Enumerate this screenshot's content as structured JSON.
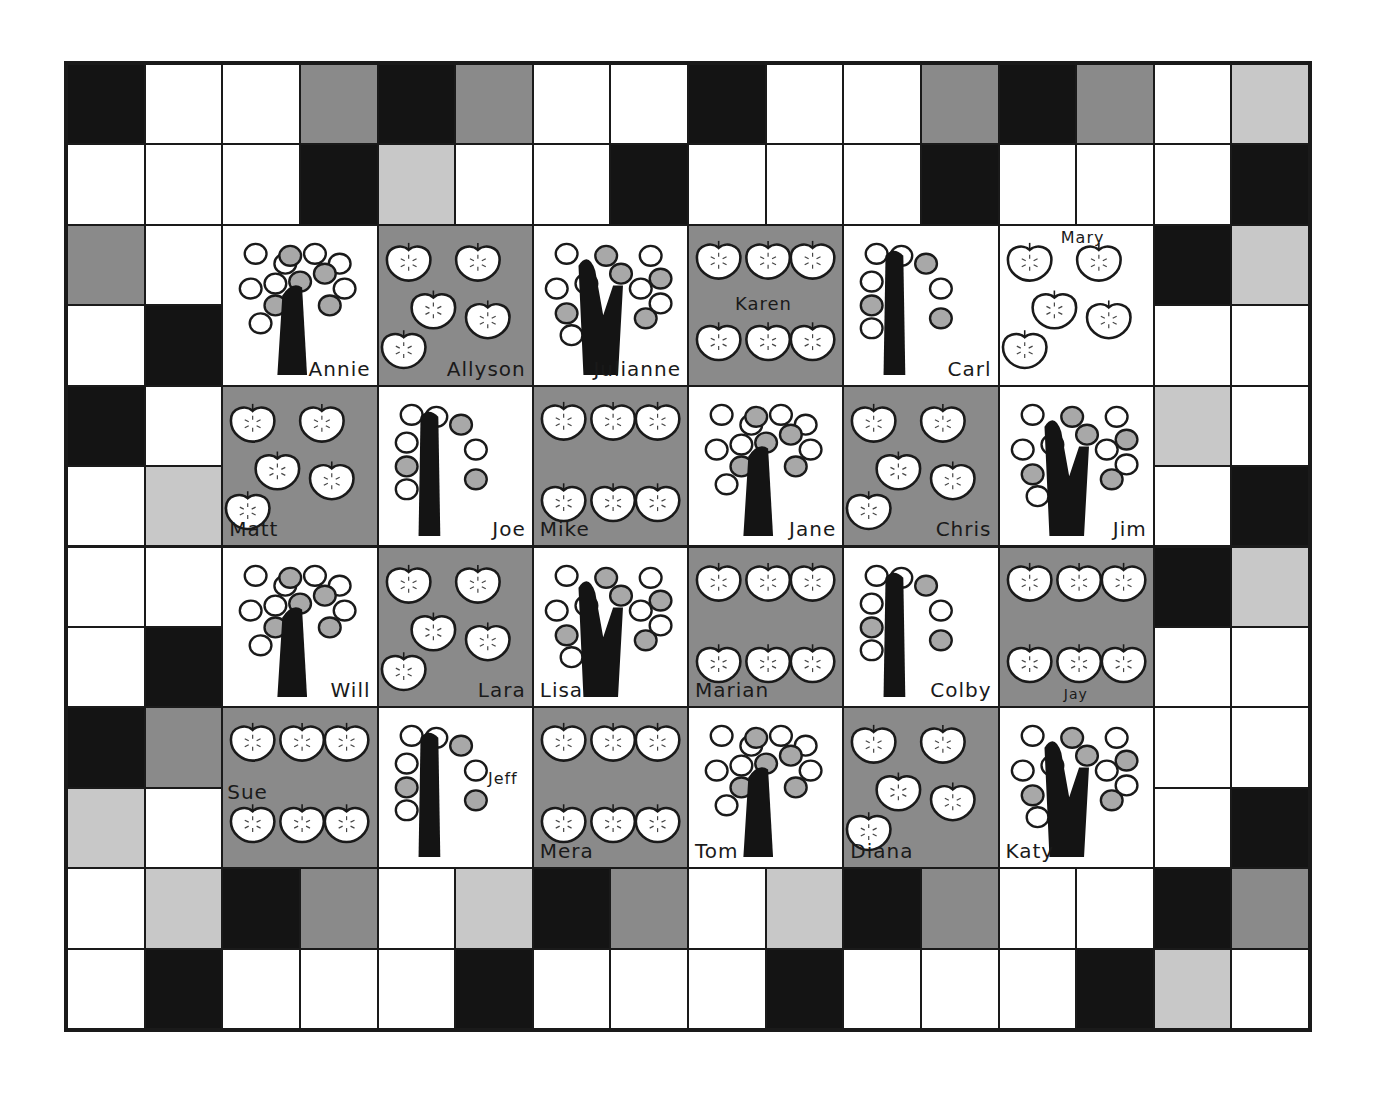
{
  "quilt": {
    "title": "Apple tree class quilt",
    "columns": 16,
    "rows": 12,
    "colors": {
      "B": "#141414",
      "G": "#8a8a8a",
      "L": "#c8c8c8",
      "W": "#ffffff",
      "line": "#1a1a1a",
      "apple_fill": "#ffffff",
      "apple_gray": "#a8a8a8",
      "trunk": "#141414"
    },
    "border_rows": {
      "0": "BWWGBGWWBWWGBGWL",
      "1": "WWWBLWWBWWWBWWWB",
      "10": "WLBGWLBGWLBGWWBG",
      "11": "WBWWWBWWWBWWWBLW"
    },
    "border_sides": {
      "left": [
        "GW",
        "WB",
        "BW",
        "WL",
        "WW",
        "WB",
        "BG",
        "LW"
      ],
      "right": [
        "BL",
        "WW",
        "LW",
        "WB",
        "BL",
        "WW",
        "WW",
        "WB"
      ]
    },
    "blocks": [
      {
        "name": "Annie",
        "type": "tree",
        "bg": "W",
        "name_pos": "br"
      },
      {
        "name": "Allyson",
        "type": "apples",
        "bg": "G",
        "name_pos": "br",
        "apples": 5
      },
      {
        "name": "Julianne",
        "type": "tree",
        "bg": "W",
        "name_pos": "br"
      },
      {
        "name": "Karen",
        "type": "apples",
        "bg": "G",
        "name_pos": "mid",
        "apples": 6
      },
      {
        "name": "Carl",
        "type": "tree",
        "bg": "W",
        "name_pos": "br"
      },
      {
        "name": "Mary",
        "type": "apples",
        "bg": "W",
        "name_pos": "top",
        "apples": 5
      },
      {
        "name": "Matt",
        "type": "apples",
        "bg": "G",
        "name_pos": "bl",
        "apples": 5
      },
      {
        "name": "Joe",
        "type": "tree",
        "bg": "W",
        "name_pos": "br"
      },
      {
        "name": "Mike",
        "type": "apples",
        "bg": "G",
        "name_pos": "bl",
        "apples": 6
      },
      {
        "name": "Jane",
        "type": "tree",
        "bg": "W",
        "name_pos": "br"
      },
      {
        "name": "Chris",
        "type": "apples",
        "bg": "G",
        "name_pos": "br",
        "apples": 5
      },
      {
        "name": "Jim",
        "type": "tree",
        "bg": "W",
        "name_pos": "br"
      },
      {
        "name": "Will",
        "type": "tree",
        "bg": "W",
        "name_pos": "br"
      },
      {
        "name": "Lara",
        "type": "apples",
        "bg": "G",
        "name_pos": "br",
        "apples": 5
      },
      {
        "name": "Lisa",
        "type": "tree",
        "bg": "W",
        "name_pos": "bl"
      },
      {
        "name": "Marian",
        "type": "apples",
        "bg": "G",
        "name_pos": "bl",
        "apples": 6
      },
      {
        "name": "Colby",
        "type": "tree",
        "bg": "W",
        "name_pos": "br"
      },
      {
        "name": "Jay",
        "type": "apples",
        "bg": "G",
        "name_pos": "bm",
        "apples": 6
      },
      {
        "name": "Sue",
        "type": "apples",
        "bg": "G",
        "name_pos": "ml",
        "apples": 6
      },
      {
        "name": "Jeff",
        "type": "tree",
        "bg": "W",
        "name_pos": "mr"
      },
      {
        "name": "Mera",
        "type": "apples",
        "bg": "G",
        "name_pos": "bl",
        "apples": 6
      },
      {
        "name": "Tom",
        "type": "tree",
        "bg": "W",
        "name_pos": "bl"
      },
      {
        "name": "Diana",
        "type": "apples",
        "bg": "G",
        "name_pos": "bl",
        "apples": 5
      },
      {
        "name": "Katy",
        "type": "tree",
        "bg": "W",
        "name_pos": "bl"
      }
    ]
  }
}
